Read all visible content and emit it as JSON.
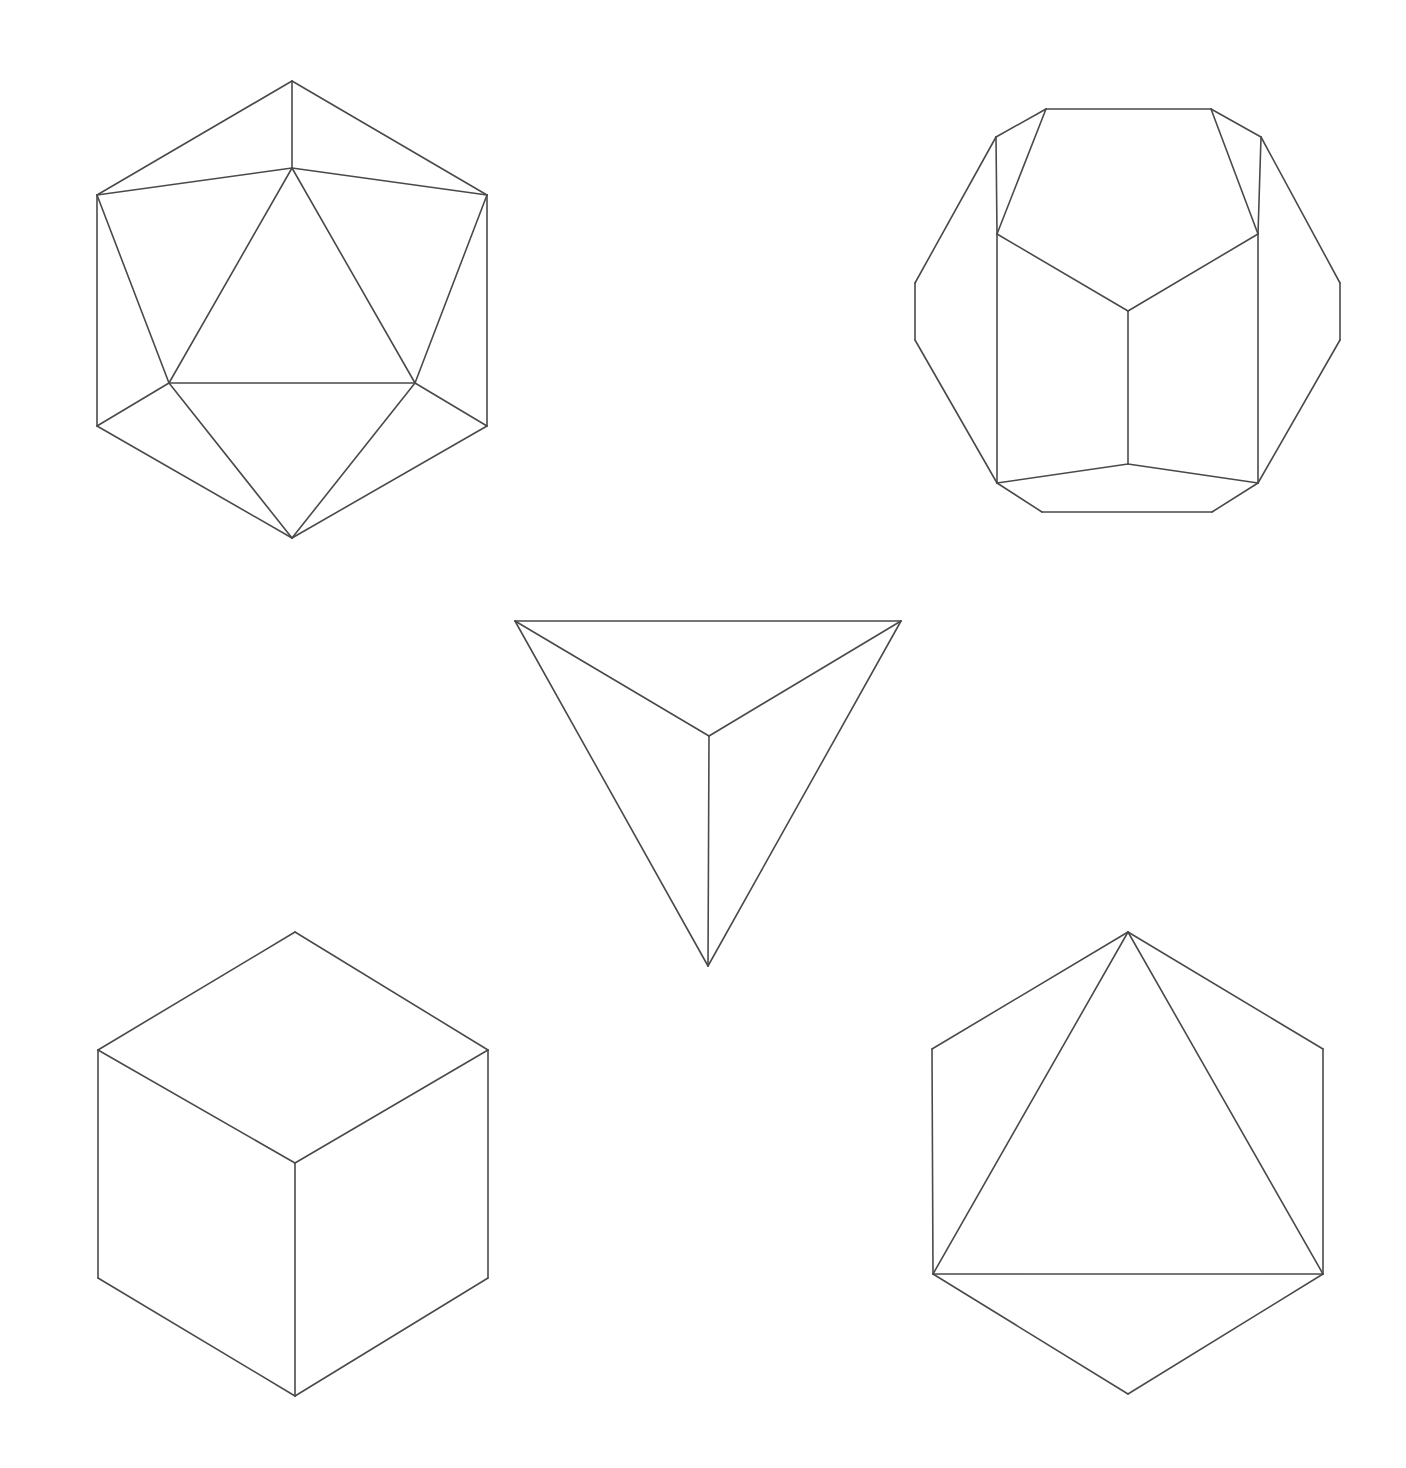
{
  "page": {
    "background_color": "#ffffff",
    "stroke_color": "#4a4a4a",
    "stroke_width": 1.6,
    "width": 1406,
    "height": 1468
  },
  "figures": [
    {
      "id": "icosahedron",
      "name": "Icosahedron",
      "position": "top-left",
      "faces": 20,
      "vertices_count": 12,
      "edges_count": 30,
      "bounds": {
        "x": 97,
        "y": 81,
        "width": 390,
        "height": 457
      },
      "vertices": {
        "top_apex": [
          292,
          81
        ],
        "upper_left": [
          97,
          195
        ],
        "upper_right": [
          487,
          195
        ],
        "inner_top": [
          292,
          168
        ],
        "inner_bottom_left": [
          169,
          383
        ],
        "inner_bottom_right": [
          415,
          383
        ],
        "lower_left": [
          97,
          426
        ],
        "lower_right": [
          487,
          426
        ],
        "bottom_apex": [
          292,
          538
        ]
      },
      "edges": [
        [
          [
            292,
            81
          ],
          [
            97,
            195
          ]
        ],
        [
          [
            292,
            81
          ],
          [
            487,
            195
          ]
        ],
        [
          [
            292,
            81
          ],
          [
            292,
            168
          ]
        ],
        [
          [
            97,
            195
          ],
          [
            292,
            168
          ]
        ],
        [
          [
            487,
            195
          ],
          [
            292,
            168
          ]
        ],
        [
          [
            97,
            195
          ],
          [
            97,
            426
          ]
        ],
        [
          [
            487,
            195
          ],
          [
            487,
            426
          ]
        ],
        [
          [
            97,
            195
          ],
          [
            169,
            383
          ]
        ],
        [
          [
            487,
            195
          ],
          [
            415,
            383
          ]
        ],
        [
          [
            292,
            168
          ],
          [
            169,
            383
          ]
        ],
        [
          [
            292,
            168
          ],
          [
            415,
            383
          ]
        ],
        [
          [
            169,
            383
          ],
          [
            415,
            383
          ]
        ],
        [
          [
            169,
            383
          ],
          [
            97,
            426
          ]
        ],
        [
          [
            415,
            383
          ],
          [
            487,
            426
          ]
        ],
        [
          [
            97,
            426
          ],
          [
            292,
            538
          ]
        ],
        [
          [
            487,
            426
          ],
          [
            292,
            538
          ]
        ],
        [
          [
            169,
            383
          ],
          [
            292,
            538
          ]
        ],
        [
          [
            415,
            383
          ],
          [
            292,
            538
          ]
        ]
      ]
    },
    {
      "id": "dodecahedron",
      "name": "Dodecahedron",
      "position": "top-right",
      "faces": 12,
      "vertices_count": 20,
      "edges_count": 30,
      "bounds": {
        "x": 915,
        "y": 109,
        "width": 425,
        "height": 403
      },
      "vertices": {
        "top_left": [
          1046,
          109
        ],
        "top_right": [
          1211,
          109
        ],
        "shoulder_left": [
          996,
          137
        ],
        "shoulder_right": [
          1261,
          137
        ],
        "mid_left": [
          997,
          234
        ],
        "mid_right": [
          1258,
          234
        ],
        "center": [
          1128,
          311
        ],
        "far_left_top": [
          915,
          283
        ],
        "far_left_bottom": [
          915,
          340
        ],
        "far_right_top": [
          1340,
          283
        ],
        "far_right_bottom": [
          1340,
          340
        ],
        "low_left": [
          997,
          483
        ],
        "low_right": [
          1258,
          483
        ],
        "bottom_left": [
          1042,
          512
        ],
        "bottom_right": [
          1212,
          512
        ],
        "bottom_center": [
          1128,
          464
        ]
      },
      "edges": [
        [
          [
            1046,
            109
          ],
          [
            1211,
            109
          ]
        ],
        [
          [
            1046,
            109
          ],
          [
            996,
            137
          ]
        ],
        [
          [
            1211,
            109
          ],
          [
            1261,
            137
          ]
        ],
        [
          [
            996,
            137
          ],
          [
            915,
            283
          ]
        ],
        [
          [
            1261,
            137
          ],
          [
            1340,
            283
          ]
        ],
        [
          [
            915,
            283
          ],
          [
            915,
            340
          ]
        ],
        [
          [
            1340,
            283
          ],
          [
            1340,
            340
          ]
        ],
        [
          [
            915,
            340
          ],
          [
            997,
            483
          ]
        ],
        [
          [
            1340,
            340
          ],
          [
            1258,
            483
          ]
        ],
        [
          [
            1046,
            109
          ],
          [
            997,
            234
          ]
        ],
        [
          [
            1211,
            109
          ],
          [
            1258,
            234
          ]
        ],
        [
          [
            996,
            137
          ],
          [
            997,
            234
          ]
        ],
        [
          [
            1261,
            137
          ],
          [
            1258,
            234
          ]
        ],
        [
          [
            997,
            234
          ],
          [
            1128,
            311
          ]
        ],
        [
          [
            1258,
            234
          ],
          [
            1128,
            311
          ]
        ],
        [
          [
            1128,
            311
          ],
          [
            1128,
            464
          ]
        ],
        [
          [
            997,
            234
          ],
          [
            997,
            483
          ]
        ],
        [
          [
            1258,
            234
          ],
          [
            1258,
            483
          ]
        ],
        [
          [
            997,
            483
          ],
          [
            1128,
            464
          ]
        ],
        [
          [
            1258,
            483
          ],
          [
            1128,
            464
          ]
        ],
        [
          [
            997,
            483
          ],
          [
            1042,
            512
          ]
        ],
        [
          [
            1258,
            483
          ],
          [
            1212,
            512
          ]
        ],
        [
          [
            1042,
            512
          ],
          [
            1212,
            512
          ]
        ]
      ]
    },
    {
      "id": "tetrahedron",
      "name": "Tetrahedron",
      "position": "center",
      "faces": 4,
      "vertices_count": 4,
      "edges_count": 6,
      "bounds": {
        "x": 515,
        "y": 621,
        "width": 386,
        "height": 345
      },
      "vertices": {
        "top_left": [
          515,
          621
        ],
        "top_right": [
          901,
          621
        ],
        "bottom_apex": [
          708,
          966
        ],
        "center": [
          709,
          736
        ]
      },
      "edges": [
        [
          [
            515,
            621
          ],
          [
            901,
            621
          ]
        ],
        [
          [
            515,
            621
          ],
          [
            708,
            966
          ]
        ],
        [
          [
            901,
            621
          ],
          [
            708,
            966
          ]
        ],
        [
          [
            515,
            621
          ],
          [
            709,
            736
          ]
        ],
        [
          [
            901,
            621
          ],
          [
            709,
            736
          ]
        ],
        [
          [
            709,
            736
          ],
          [
            708,
            966
          ]
        ]
      ]
    },
    {
      "id": "cube",
      "name": "Cube (Hexahedron)",
      "position": "bottom-left",
      "faces": 6,
      "vertices_count": 8,
      "edges_count": 12,
      "bounds": {
        "x": 98,
        "y": 932,
        "width": 390,
        "height": 464
      },
      "vertices": {
        "top": [
          295,
          932
        ],
        "upper_left": [
          98,
          1050
        ],
        "upper_right": [
          488,
          1050
        ],
        "center": [
          295,
          1163
        ],
        "lower_left": [
          98,
          1278
        ],
        "lower_right": [
          488,
          1278
        ],
        "bottom": [
          295,
          1396
        ]
      },
      "edges": [
        [
          [
            295,
            932
          ],
          [
            98,
            1050
          ]
        ],
        [
          [
            295,
            932
          ],
          [
            488,
            1050
          ]
        ],
        [
          [
            98,
            1050
          ],
          [
            295,
            1163
          ]
        ],
        [
          [
            488,
            1050
          ],
          [
            295,
            1163
          ]
        ],
        [
          [
            98,
            1050
          ],
          [
            98,
            1278
          ]
        ],
        [
          [
            488,
            1050
          ],
          [
            488,
            1278
          ]
        ],
        [
          [
            295,
            1163
          ],
          [
            295,
            1396
          ]
        ],
        [
          [
            98,
            1278
          ],
          [
            295,
            1396
          ]
        ],
        [
          [
            488,
            1278
          ],
          [
            295,
            1396
          ]
        ]
      ]
    },
    {
      "id": "octahedron",
      "name": "Octahedron",
      "position": "bottom-right",
      "faces": 8,
      "vertices_count": 6,
      "edges_count": 12,
      "bounds": {
        "x": 932,
        "y": 932,
        "width": 391,
        "height": 462
      },
      "vertices": {
        "top_apex": [
          1128,
          932
        ],
        "upper_left": [
          932,
          1049
        ],
        "upper_right": [
          1323,
          1049
        ],
        "lower_left": [
          933,
          1274
        ],
        "lower_right": [
          1323,
          1274
        ],
        "bottom_apex": [
          1128,
          1394
        ]
      },
      "edges": [
        [
          [
            1128,
            932
          ],
          [
            932,
            1049
          ]
        ],
        [
          [
            1128,
            932
          ],
          [
            1323,
            1049
          ]
        ],
        [
          [
            1128,
            932
          ],
          [
            933,
            1274
          ]
        ],
        [
          [
            1128,
            932
          ],
          [
            1323,
            1274
          ]
        ],
        [
          [
            932,
            1049
          ],
          [
            933,
            1274
          ]
        ],
        [
          [
            1323,
            1049
          ],
          [
            1323,
            1274
          ]
        ],
        [
          [
            933,
            1274
          ],
          [
            1323,
            1274
          ]
        ],
        [
          [
            933,
            1274
          ],
          [
            1128,
            1394
          ]
        ],
        [
          [
            1323,
            1274
          ],
          [
            1128,
            1394
          ]
        ]
      ]
    }
  ]
}
